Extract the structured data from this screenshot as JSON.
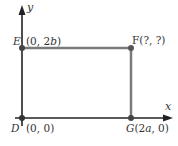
{
  "diagram": {
    "title": "",
    "axes": {
      "x_label": "x",
      "y_label": "y",
      "axis_color": "#222222"
    },
    "rectangle": {
      "edge_color": "#7a7a7a"
    },
    "points": [
      {
        "name": "E",
        "coords": "(0, 2b)",
        "position": "top-left"
      },
      {
        "name": "F",
        "coords": "(?, ?)",
        "position": "top-right"
      },
      {
        "name": "D",
        "coords": "(0, 0)",
        "position": "origin"
      },
      {
        "name": "G",
        "coords": "(2a, 0)",
        "position": "bottom-right"
      }
    ],
    "labels": {
      "E_name": "E",
      "E_coords": "(0, 2",
      "E_coords_var": "b",
      "E_coords_end": ")",
      "F_full": "F(?, ?)",
      "D_name": "D",
      "D_coords": "(0, 0)",
      "G_name": "G",
      "G_coords_start": "(2",
      "G_coords_var": "a",
      "G_coords_end": ", 0)"
    }
  }
}
